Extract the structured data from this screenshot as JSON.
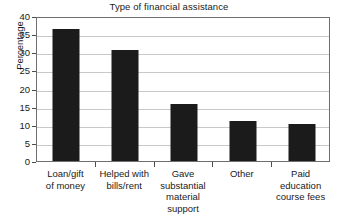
{
  "chart_data": {
    "type": "bar",
    "title": "Type of financial assistance",
    "xlabel": "",
    "ylabel": "Percentage",
    "categories": [
      "Loan/gift of money",
      "Helped with bills/rent",
      "Gave substantial material support",
      "Other",
      "Paid education course fees"
    ],
    "category_lines": [
      [
        "Loan/gift",
        "of money"
      ],
      [
        "Helped with",
        "bills/rent"
      ],
      [
        "Gave",
        "substantial",
        "material",
        "support"
      ],
      [
        "Other"
      ],
      [
        "Paid",
        "education",
        "course fees"
      ]
    ],
    "values": [
      36.5,
      30.5,
      15.6,
      11.0,
      10.2
    ],
    "ylim": [
      0,
      40
    ],
    "ytick_values": [
      0,
      5,
      10,
      15,
      20,
      25,
      30,
      35,
      40
    ],
    "ytick_labels": [
      "0",
      "5",
      "10",
      "15",
      "20",
      "25",
      "30",
      "35",
      "40"
    ],
    "grid": true,
    "legend": false,
    "bar_color": "#1b1b1b",
    "grid_color": "#c9c9c9",
    "axis_color": "#6e6e6e",
    "background_color": "#ffffff"
  }
}
